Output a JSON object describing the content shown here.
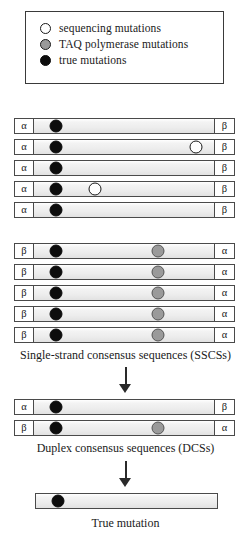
{
  "legend": {
    "items": [
      {
        "marker": "open-circle",
        "label": "sequencing mutations"
      },
      {
        "marker": "gray-circle",
        "label": "TAQ polymerase mutations"
      },
      {
        "marker": "black-circle",
        "label": "true mutations"
      }
    ]
  },
  "groups": [
    {
      "name": "sscs-alpha-group",
      "rows": [
        {
          "left_cap": "α",
          "right_cap": "β",
          "marks": [
            {
              "type": "black",
              "pos": 12
            }
          ]
        },
        {
          "left_cap": "α",
          "right_cap": "β",
          "marks": [
            {
              "type": "black",
              "pos": 12
            },
            {
              "type": "open",
              "pos": 90
            }
          ]
        },
        {
          "left_cap": "α",
          "right_cap": "β",
          "marks": [
            {
              "type": "black",
              "pos": 12
            }
          ]
        },
        {
          "left_cap": "α",
          "right_cap": "β",
          "marks": [
            {
              "type": "black",
              "pos": 12
            },
            {
              "type": "open",
              "pos": 34
            }
          ]
        },
        {
          "left_cap": "α",
          "right_cap": "β",
          "marks": [
            {
              "type": "black",
              "pos": 12
            }
          ]
        }
      ]
    },
    {
      "name": "sscs-beta-group",
      "rows": [
        {
          "left_cap": "β",
          "right_cap": "α",
          "marks": [
            {
              "type": "black",
              "pos": 12
            },
            {
              "type": "gray",
              "pos": 69
            }
          ]
        },
        {
          "left_cap": "β",
          "right_cap": "α",
          "marks": [
            {
              "type": "black",
              "pos": 12
            },
            {
              "type": "gray",
              "pos": 69
            }
          ]
        },
        {
          "left_cap": "β",
          "right_cap": "α",
          "marks": [
            {
              "type": "black",
              "pos": 12
            },
            {
              "type": "gray",
              "pos": 69
            }
          ]
        },
        {
          "left_cap": "β",
          "right_cap": "α",
          "marks": [
            {
              "type": "black",
              "pos": 12
            },
            {
              "type": "gray",
              "pos": 69
            }
          ]
        },
        {
          "left_cap": "β",
          "right_cap": "α",
          "marks": [
            {
              "type": "black",
              "pos": 12
            },
            {
              "type": "gray",
              "pos": 69
            }
          ]
        }
      ]
    },
    {
      "name": "dcs-group",
      "rows": [
        {
          "left_cap": "α",
          "right_cap": "β",
          "marks": [
            {
              "type": "black",
              "pos": 12
            }
          ]
        },
        {
          "left_cap": "β",
          "right_cap": "α",
          "marks": [
            {
              "type": "black",
              "pos": 12
            },
            {
              "type": "gray",
              "pos": 69
            }
          ]
        }
      ]
    },
    {
      "name": "true-mutation-group",
      "rows": [
        {
          "left_cap": "",
          "right_cap": "",
          "marks": [
            {
              "type": "black",
              "pos": 12
            }
          ]
        }
      ]
    }
  ],
  "captions": {
    "sscs": "Single-strand consensus sequences (SSCSs)",
    "dcs": "Duplex consensus sequences (DCSs)",
    "true_mutation": "True mutation"
  },
  "colors": {
    "true_mutation": "#0d0d0d",
    "taq_mutation": "#9a9a9a",
    "sequencing_mutation": "#ffffff",
    "strand_fill": "#ededed",
    "outline": "#4a4a4a",
    "arrow": "#2a2a2a"
  }
}
